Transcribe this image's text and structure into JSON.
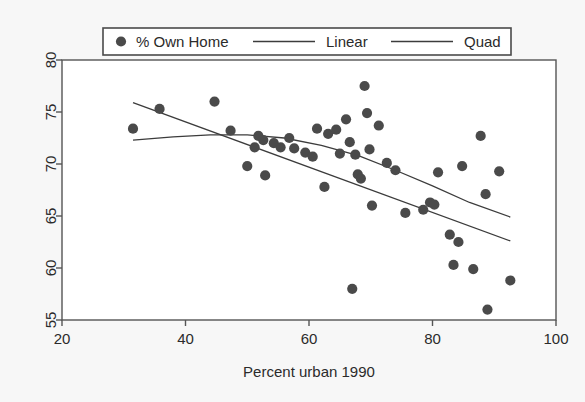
{
  "chart_data": {
    "type": "scatter",
    "title": "",
    "subtitle": "",
    "xlabel": "Percent urban 1990",
    "ylabel": "",
    "xlim": [
      20,
      100
    ],
    "ylim": [
      55,
      80
    ],
    "xticks": [
      20,
      40,
      60,
      80,
      100
    ],
    "yticks": [
      55,
      60,
      65,
      70,
      75,
      80
    ],
    "xtick_labels": [
      "20",
      "40",
      "60",
      "80",
      "100"
    ],
    "ytick_labels": [
      "55",
      "60",
      "65",
      "70",
      "75",
      "80"
    ],
    "grid": false,
    "legend_position": "top-outside",
    "marker_color": "#4a4a4a",
    "line_color": "#3c3c3c",
    "frame_color": "#555555",
    "plot_background": "#ffffff",
    "figure_background": "#f7f7f7",
    "legend": [
      {
        "label": "% Own Home",
        "type": "marker",
        "symbol": "filled-circle"
      },
      {
        "label": "Linear",
        "type": "line"
      },
      {
        "label": "Quad",
        "type": "line"
      }
    ],
    "series": [
      {
        "name": "% Own Home",
        "type": "scatter",
        "points": [
          [
            31.5,
            73.4
          ],
          [
            35.8,
            75.3
          ],
          [
            44.7,
            76.0
          ],
          [
            47.3,
            73.2
          ],
          [
            50.0,
            69.8
          ],
          [
            51.2,
            71.6
          ],
          [
            51.8,
            72.7
          ],
          [
            52.6,
            72.3
          ],
          [
            52.9,
            68.9
          ],
          [
            54.3,
            72.0
          ],
          [
            55.4,
            71.6
          ],
          [
            56.8,
            72.5
          ],
          [
            57.6,
            71.5
          ],
          [
            59.4,
            71.1
          ],
          [
            60.6,
            70.7
          ],
          [
            61.3,
            73.4
          ],
          [
            62.5,
            67.8
          ],
          [
            63.1,
            72.9
          ],
          [
            64.4,
            73.3
          ],
          [
            65.0,
            71.0
          ],
          [
            66.0,
            74.3
          ],
          [
            66.6,
            72.1
          ],
          [
            67.0,
            58.0
          ],
          [
            67.5,
            70.9
          ],
          [
            67.9,
            69.0
          ],
          [
            68.4,
            68.6
          ],
          [
            69.0,
            77.5
          ],
          [
            69.4,
            74.9
          ],
          [
            69.8,
            71.4
          ],
          [
            70.2,
            66.0
          ],
          [
            71.3,
            73.7
          ],
          [
            72.6,
            70.1
          ],
          [
            74.0,
            69.4
          ],
          [
            75.6,
            65.3
          ],
          [
            78.5,
            65.6
          ],
          [
            79.6,
            66.3
          ],
          [
            80.3,
            66.1
          ],
          [
            80.9,
            69.2
          ],
          [
            82.8,
            63.2
          ],
          [
            83.4,
            60.3
          ],
          [
            84.2,
            62.5
          ],
          [
            84.8,
            69.8
          ],
          [
            86.6,
            59.9
          ],
          [
            87.8,
            72.7
          ],
          [
            88.6,
            67.1
          ],
          [
            88.9,
            56.0
          ],
          [
            90.8,
            69.3
          ],
          [
            92.6,
            58.8
          ]
        ]
      },
      {
        "name": "Linear",
        "type": "line",
        "x_range": [
          31.5,
          92.6
        ],
        "points": [
          [
            31.5,
            75.9
          ],
          [
            92.6,
            62.6
          ]
        ]
      },
      {
        "name": "Quad",
        "type": "line",
        "x_range": [
          31.5,
          92.6
        ],
        "points": [
          [
            31.5,
            72.3
          ],
          [
            38.0,
            72.6
          ],
          [
            44.0,
            72.8
          ],
          [
            50.0,
            72.8
          ],
          [
            56.0,
            72.5
          ],
          [
            62.0,
            71.8
          ],
          [
            68.0,
            70.8
          ],
          [
            74.0,
            69.4
          ],
          [
            80.0,
            67.9
          ],
          [
            86.0,
            66.3
          ],
          [
            92.6,
            64.9
          ]
        ]
      }
    ]
  },
  "geometry": {
    "plot_left": 62,
    "plot_right": 556,
    "plot_top": 60,
    "plot_bottom": 320
  }
}
